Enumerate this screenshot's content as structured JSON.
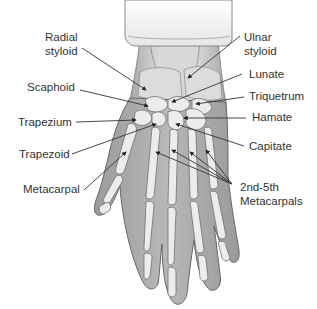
{
  "figure": {
    "colors": {
      "background": "#ffffff",
      "sleeve": "#f4f4f4",
      "sleeve_shadow": "#d6d6d6",
      "skin": "#a9a9a9",
      "skin_dark": "#8c8c8c",
      "bone": "#e8e8e8",
      "bone_outline": "#6e6e6e",
      "leader_line": "#333333",
      "text": "#333333"
    }
  },
  "labels": {
    "radial_styloid": {
      "line1": "Radial",
      "line2": "styloid"
    },
    "scaphoid": "Scaphoid",
    "trapezium": "Trapezium",
    "trapezoid": "Trapezoid",
    "metacarpal": "Metacarpal",
    "ulnar_styloid": {
      "line1": "Ulnar",
      "line2": "styloid"
    },
    "lunate": "Lunate",
    "triquetrum": "Triquetrum",
    "hamate": "Hamate",
    "capitate": "Capitate",
    "metacarpals_2_5": {
      "line1": "2nd-5th",
      "line2": "Metacarpals"
    }
  }
}
